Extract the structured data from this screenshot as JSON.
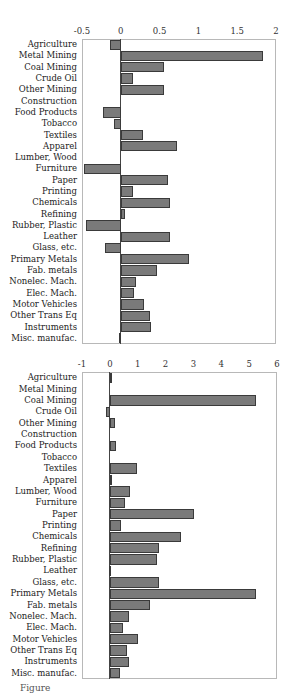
{
  "caption": "Figure",
  "chart_data": [
    {
      "type": "bar",
      "orientation": "horizontal",
      "title": "",
      "xlabel": "",
      "ylabel": "",
      "xlim": [
        -0.5,
        2
      ],
      "xticks": [
        "-0.5",
        "0",
        "0.5",
        "1",
        "1.5",
        "2"
      ],
      "grid": false,
      "legend": null,
      "categories": [
        "Agriculture",
        "Metal Mining",
        "Coal Mining",
        "Crude Oil",
        "Other Mining",
        "Construction",
        "Food Products",
        "Tobacco",
        "Textiles",
        "Apparel",
        "Lumber, Wood",
        "Furniture",
        "Paper",
        "Printing",
        "Chemicals",
        "Refining",
        "Rubber, Plastic",
        "Leather",
        "Glass, etc.",
        "Primary Metals",
        "Fab. metals",
        "Nonelec. Mach.",
        "Elec. Mach.",
        "Motor Vehicles",
        "Other Trans Eq",
        "Instruments",
        "Misc. manufac."
      ],
      "values": [
        -0.14,
        1.83,
        0.56,
        0.16,
        0.56,
        0.0,
        -0.23,
        -0.09,
        0.28,
        0.73,
        0.0,
        -0.48,
        0.61,
        0.16,
        0.63,
        0.05,
        -0.45,
        0.64,
        -0.21,
        0.88,
        0.47,
        0.19,
        0.17,
        0.3,
        0.38,
        0.39,
        -0.02
      ]
    },
    {
      "type": "bar",
      "orientation": "horizontal",
      "title": "",
      "xlabel": "",
      "ylabel": "",
      "xlim": [
        -1,
        6
      ],
      "xticks": [
        "-1",
        "0",
        "1",
        "2",
        "3",
        "4",
        "5",
        "6"
      ],
      "grid": false,
      "legend": null,
      "categories": [
        "Agriculture",
        "Metal Mining",
        "Coal Mining",
        "Crude Oil",
        "Other Mining",
        "Construction",
        "Food Products",
        "Tobacco",
        "Textiles",
        "Apparel",
        "Lumber, Wood",
        "Furniture",
        "Paper",
        "Printing",
        "Chemicals",
        "Refining",
        "Rubber, Plastic",
        "Leather",
        "Glass, etc.",
        "Primary Metals",
        "Fab. metals",
        "Nonelec. Mach.",
        "Elec. Mach.",
        "Motor Vehicles",
        "Other Trans Eq",
        "Instruments",
        "Misc. manufac."
      ],
      "values": [
        0.07,
        0.0,
        5.25,
        -0.14,
        0.18,
        0.0,
        0.21,
        0.0,
        0.96,
        0.05,
        0.73,
        0.56,
        3.03,
        0.4,
        2.57,
        1.77,
        1.68,
        -0.02,
        1.76,
        5.24,
        1.45,
        0.69,
        0.48,
        1.0,
        0.63,
        0.7,
        0.35
      ]
    }
  ],
  "colors": {
    "bar_fill": "#7a7a7a",
    "bar_edge": "#3a3a3a",
    "frame": "#b8b8b8"
  }
}
